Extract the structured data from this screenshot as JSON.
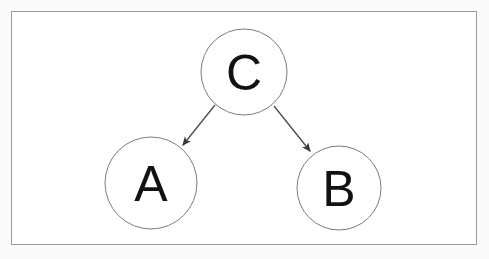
{
  "canvas": {
    "width": 489,
    "height": 259,
    "background_color": "#fafafa",
    "frame": {
      "x": 11,
      "y": 11,
      "width": 466,
      "height": 234,
      "border_color": "#9a9a9a",
      "fill_color": "#ffffff"
    }
  },
  "diagram": {
    "type": "directed-graph",
    "node_stroke_color": "#7d7d7d",
    "node_fill_color": "#ffffff",
    "label_color": "#121212",
    "edge_color": "#4a4a4a",
    "nodes": [
      {
        "id": "C",
        "label": "C",
        "cx": 244,
        "cy": 72,
        "r": 43
      },
      {
        "id": "A",
        "label": "A",
        "cx": 151,
        "cy": 183,
        "r": 46
      },
      {
        "id": "B",
        "label": "B",
        "cx": 339,
        "cy": 188,
        "r": 42
      }
    ],
    "edges": [
      {
        "from": "C",
        "to": "A",
        "arrowhead": true,
        "x1": 215,
        "y1": 105,
        "x2": 183,
        "y2": 145
      },
      {
        "from": "C",
        "to": "B",
        "arrowhead": true,
        "x1": 274,
        "y1": 106,
        "x2": 310,
        "y2": 151
      }
    ]
  }
}
